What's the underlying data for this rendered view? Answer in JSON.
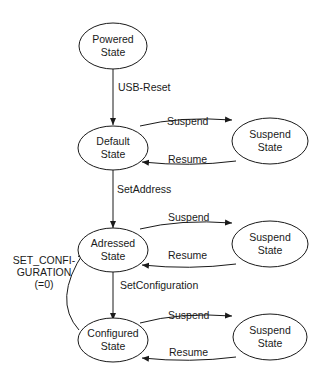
{
  "diagram": {
    "states": {
      "powered": {
        "line1": "Powered",
        "line2": "State"
      },
      "default": {
        "line1": "Default",
        "line2": "State"
      },
      "suspend1": {
        "line1": "Suspend",
        "line2": "State"
      },
      "addressed": {
        "line1": "Adressed",
        "line2": "State"
      },
      "suspend2": {
        "line1": "Suspend",
        "line2": "State"
      },
      "configured": {
        "line1": "Configured",
        "line2": "State"
      },
      "suspend3": {
        "line1": "Suspend",
        "line2": "State"
      }
    },
    "transitions": {
      "usb_reset": "USB-Reset",
      "suspend1": "Suspend",
      "resume1": "Resume",
      "set_address": "SetAddress",
      "suspend2": "Suspend",
      "resume2": "Resume",
      "set_configuration": "SetConfiguration",
      "suspend3": "Suspend",
      "resume3": "Resume",
      "set_config_zero": {
        "line1": "SET_CONFI-",
        "line2": "GURATION",
        "line3": "(=0)"
      }
    }
  }
}
